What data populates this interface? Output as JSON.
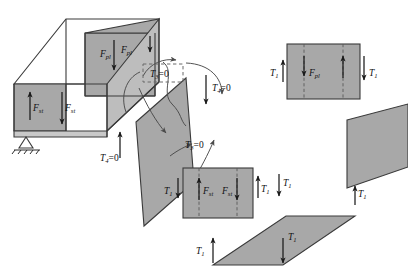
{
  "figure": {
    "name": "free-body-diagram-exploded-beam",
    "background_color": "#ffffff",
    "face_fill": "#a8a8a8",
    "face_fill_light": "#bdbdbd",
    "line_color": "#3a3a3a",
    "arrow_color": "#1a1a1a"
  },
  "labels": {
    "f_pl_top_left": {
      "base": "F",
      "sub": "pl"
    },
    "f_pl_top_right": {
      "base": "F",
      "sub": "pl"
    },
    "f_st_box_left": {
      "base": "F",
      "sub": "st"
    },
    "f_st_box_right": {
      "base": "F",
      "sub": "st"
    },
    "f_pl_right_panel": {
      "base": "F",
      "sub": "pl"
    },
    "f_st_mid_left": {
      "base": "F",
      "sub": "st"
    },
    "f_st_mid_right": {
      "base": "F",
      "sub": "st"
    },
    "t3_dashed_box": {
      "base": "T",
      "sub": "3",
      "eq": "=0"
    },
    "t3_mid": {
      "base": "T",
      "sub": "3",
      "eq": "=0"
    },
    "t4_right": {
      "base": "T",
      "sub": "4",
      "eq": "=0"
    },
    "t4_left": {
      "base": "T",
      "sub": "4",
      "eq": "=0"
    },
    "t1_panel_left": {
      "base": "T",
      "sub": "1"
    },
    "t1_panel_right": {
      "base": "T",
      "sub": "1"
    },
    "t1_mid_left": {
      "base": "T",
      "sub": "1"
    },
    "t1_mid_right": {
      "base": "T",
      "sub": "1"
    },
    "t1_mid_far_right": {
      "base": "T",
      "sub": "1"
    },
    "t1_corner_right": {
      "base": "T",
      "sub": "1"
    },
    "t1_bottom_left": {
      "base": "T",
      "sub": "1"
    },
    "t1_bottom_right": {
      "base": "T",
      "sub": "1"
    }
  },
  "elements": {
    "box_3d": "rectangular-box-solid",
    "pin_support": "pinned-support-triangle",
    "inclined_panel": "inclined-shear-panel",
    "right_panel": "vertical-rectangular-panel",
    "mid_panel": "vertical-rectangular-panel",
    "right_slanted_panel": "slanted-rectangular-panel",
    "bottom_panel": "horizontal-parallelogram-panel"
  }
}
